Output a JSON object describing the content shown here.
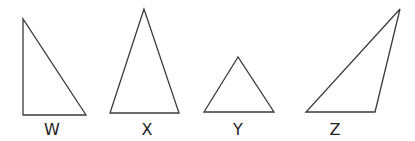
{
  "diagram": {
    "type": "triangles",
    "stroke_color": "#3a3a3a",
    "triangles": [
      {
        "id": "W",
        "label": "W",
        "kind": "right",
        "points": "23,19 23,115 86,115",
        "label_x": 52
      },
      {
        "id": "X",
        "label": "X",
        "kind": "isosceles",
        "points": "144,9 110,113 179,113",
        "label_x": 147
      },
      {
        "id": "Y",
        "label": "Y",
        "kind": "equilateral",
        "points": "238,57 204,112 274,112",
        "label_x": 238
      },
      {
        "id": "Z",
        "label": "Z",
        "kind": "obtuse",
        "points": "400,9 306,112 375,112",
        "label_x": 335
      }
    ]
  }
}
